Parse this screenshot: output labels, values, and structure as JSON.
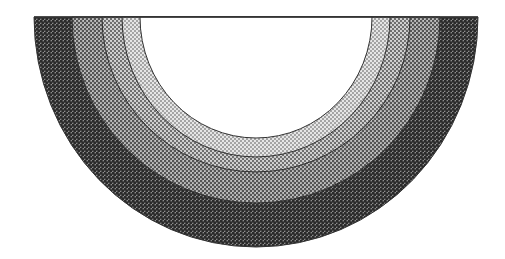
{
  "diagram": {
    "type": "concentric-semicircular-bands",
    "center": {
      "x": 256,
      "y": 17
    },
    "top_edge_y": 17,
    "bands": [
      {
        "name": "band-outer",
        "rx": 222,
        "ry": 230,
        "shade": "dark",
        "dot_color": "#2a2a2a",
        "base_color": "#8c8c8c"
      },
      {
        "name": "band-third",
        "rx": 184,
        "ry": 186,
        "shade": "medium",
        "dot_color": "#555555",
        "base_color": "#c4c4c4"
      },
      {
        "name": "band-second",
        "rx": 154,
        "ry": 155,
        "shade": "light",
        "dot_color": "#6a6a6a",
        "base_color": "#d6d6d6"
      },
      {
        "name": "band-inner",
        "rx": 134,
        "ry": 140,
        "shade": "lightest",
        "dot_color": "#888888",
        "base_color": "#e6e6e6"
      }
    ],
    "core": {
      "name": "core-white",
      "rx": 116,
      "ry": 121,
      "color": "#ffffff"
    },
    "outline_color": "#333333",
    "background": "#ffffff"
  }
}
